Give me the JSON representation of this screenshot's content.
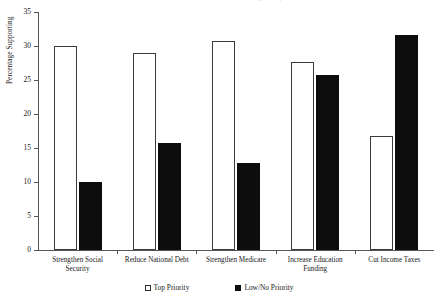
{
  "chart_data": {
    "type": "bar",
    "title": "Public Priorities for the Federal Budget Surplus",
    "xlabel": "",
    "ylabel": "Percentage Supporting",
    "ylim": [
      0,
      35
    ],
    "yticks": [
      0,
      5,
      10,
      15,
      20,
      25,
      30,
      35
    ],
    "grid": false,
    "legend_position": "bottom-center",
    "categories": [
      "Strengthen Social Security",
      "Reduce National Debt",
      "Strengthen Medicare",
      "Increase Education Funding",
      "Cut Income Taxes"
    ],
    "series": [
      {
        "name": "Top Priority",
        "color": "#ffffff",
        "edge_color": "#3a3a3a",
        "swatch": "open",
        "values": [
          30.0,
          28.9,
          30.8,
          27.7,
          16.7
        ]
      },
      {
        "name": "Low/No Priority",
        "color": "#0d0d0d",
        "edge_color": "#0d0d0d",
        "swatch": "filled",
        "values": [
          10.0,
          15.8,
          12.8,
          25.8,
          31.6
        ]
      }
    ]
  },
  "axis": {
    "y_tick_labels": [
      "0",
      "5",
      "10",
      "15",
      "20",
      "25",
      "30",
      "35"
    ],
    "y_label": "Percentage Supporting"
  },
  "category_lines": [
    [
      "Strengthen Social",
      "Security"
    ],
    [
      "Reduce National Debt",
      ""
    ],
    [
      "Strengthen Medicare",
      ""
    ],
    [
      "Increase Education",
      "Funding"
    ],
    [
      "Cut Income Taxes",
      ""
    ]
  ],
  "legend": {
    "items": [
      {
        "label": "Top Priority",
        "swatch": "open"
      },
      {
        "label": "Low/No Priority",
        "swatch": "filled"
      }
    ]
  }
}
